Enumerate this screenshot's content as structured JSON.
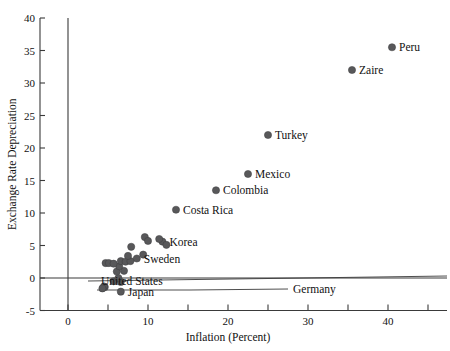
{
  "figure": {
    "name": "inflation-vs-exchange-rate-depreciation-scatter",
    "background": "#ffffff",
    "marker_color": "#58585a",
    "axis_color": "#3a3a3a"
  },
  "chart_data": {
    "type": "scatter",
    "title": "",
    "xlabel": "Inflation (Percent)",
    "ylabel": "Exchange Rate Depreciation",
    "xlim": [
      -1.5,
      45.5
    ],
    "ylim": [
      -5,
      40
    ],
    "xticks": [
      0,
      10,
      20,
      30,
      40
    ],
    "xticklabels": [
      "0",
      "10",
      "20",
      "30",
      "40"
    ],
    "xminorticks": [
      5,
      15,
      25,
      35,
      45
    ],
    "yticks": [
      -5,
      0,
      5,
      10,
      15,
      20,
      25,
      30,
      35,
      40
    ],
    "yticklabels": [
      "-5",
      "0",
      "5",
      "10",
      "15",
      "20",
      "25",
      "30",
      "35",
      "40"
    ],
    "grid": false,
    "legend": null,
    "zero_reference_line": 0,
    "points": [
      {
        "label": "Peru",
        "x": 40.5,
        "y": 35.5,
        "label_pos": "right"
      },
      {
        "label": "Zaire",
        "x": 35.5,
        "y": 32.0,
        "label_pos": "right"
      },
      {
        "label": "Turkey",
        "x": 25.0,
        "y": 22.0,
        "label_pos": "right"
      },
      {
        "label": "Mexico",
        "x": 22.5,
        "y": 16.0,
        "label_pos": "right"
      },
      {
        "label": "Colombia",
        "x": 18.5,
        "y": 13.5,
        "label_pos": "right"
      },
      {
        "label": "Costa Rica",
        "x": 13.5,
        "y": 10.5,
        "label_pos": "right"
      },
      {
        "label": "Korea",
        "x": 11.8,
        "y": 5.6,
        "label_pos": "right"
      },
      {
        "label": "Sweden",
        "x": 8.6,
        "y": 3.0,
        "label_pos": "right"
      },
      {
        "label": "United States",
        "x": 6.6,
        "y": -0.6,
        "label_pos": "leader"
      },
      {
        "label": "Japan",
        "x": 6.6,
        "y": -2.1,
        "label_pos": "right"
      },
      {
        "label": "Germany",
        "x": 4.6,
        "y": -1.4,
        "label_pos": "leader"
      },
      {
        "label": "",
        "x": 4.5,
        "y": -1.3,
        "label_pos": "none"
      },
      {
        "label": "",
        "x": 4.3,
        "y": -1.6,
        "label_pos": "none"
      },
      {
        "label": "",
        "x": 5.7,
        "y": -0.5,
        "label_pos": "none"
      },
      {
        "label": "",
        "x": 6.3,
        "y": 0.0,
        "label_pos": "none"
      },
      {
        "label": "",
        "x": 6.1,
        "y": 1.0,
        "label_pos": "none"
      },
      {
        "label": "",
        "x": 7.0,
        "y": 1.1,
        "label_pos": "none"
      },
      {
        "label": "",
        "x": 6.4,
        "y": 1.8,
        "label_pos": "none"
      },
      {
        "label": "",
        "x": 4.7,
        "y": 2.3,
        "label_pos": "none"
      },
      {
        "label": "",
        "x": 5.1,
        "y": 2.3,
        "label_pos": "none"
      },
      {
        "label": "",
        "x": 5.7,
        "y": 2.2,
        "label_pos": "none"
      },
      {
        "label": "",
        "x": 6.6,
        "y": 2.6,
        "label_pos": "none"
      },
      {
        "label": "",
        "x": 7.2,
        "y": 2.5,
        "label_pos": "none"
      },
      {
        "label": "",
        "x": 7.8,
        "y": 2.6,
        "label_pos": "none"
      },
      {
        "label": "",
        "x": 7.5,
        "y": 3.4,
        "label_pos": "none"
      },
      {
        "label": "",
        "x": 9.4,
        "y": 3.6,
        "label_pos": "none"
      },
      {
        "label": "",
        "x": 7.9,
        "y": 4.8,
        "label_pos": "none"
      },
      {
        "label": "",
        "x": 9.6,
        "y": 6.3,
        "label_pos": "none"
      },
      {
        "label": "",
        "x": 10.0,
        "y": 5.7,
        "label_pos": "none"
      },
      {
        "label": "",
        "x": 11.4,
        "y": 6.0,
        "label_pos": "none"
      },
      {
        "label": "",
        "x": 12.3,
        "y": 5.1,
        "label_pos": "none"
      }
    ]
  }
}
